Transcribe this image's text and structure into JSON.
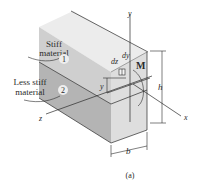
{
  "figure": {
    "caption": "(a)",
    "materials": [
      {
        "label_line1": "Stiff",
        "label_line2": "material",
        "number": "1"
      },
      {
        "label_line1": "Less stiff",
        "label_line2": "material",
        "number": "2"
      }
    ],
    "axes": {
      "x": "x",
      "y": "y",
      "z": "z"
    },
    "dimensions": {
      "height": "h",
      "width": "b",
      "offset": "y"
    },
    "element": {
      "dy": "dy",
      "dz": "dz"
    },
    "moment": "M",
    "colors": {
      "top_face": "#ececec",
      "side_upper": "#cfcfcf",
      "side_lower": "#b4b4b4",
      "front_face": "#dedede",
      "line": "#2a2a2a"
    }
  }
}
